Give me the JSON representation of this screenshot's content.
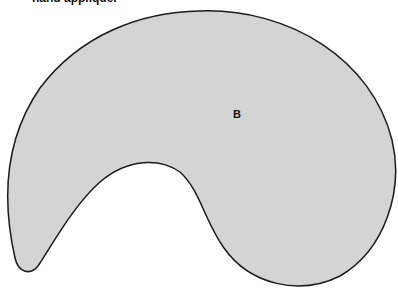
{
  "caption": "hand appliqué.",
  "shape": {
    "label": "B",
    "fill": "#d4d4d4",
    "stroke": "#1a1a1a"
  }
}
